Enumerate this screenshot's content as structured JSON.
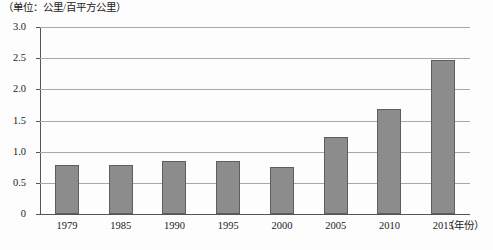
{
  "caption": "（单位：公里/百平方公里）",
  "x_axis_title": "（年份）",
  "chart_data": {
    "type": "bar",
    "title": "",
    "subtitle": "",
    "xlabel": "（年份）",
    "ylabel": "（单位：公里/百平方公里）",
    "categories": [
      "1979",
      "1985",
      "1990",
      "1995",
      "2000",
      "2005",
      "2010",
      "2015"
    ],
    "values": [
      0.78,
      0.78,
      0.85,
      0.85,
      0.76,
      1.23,
      1.68,
      2.47
    ],
    "ylim": [
      0,
      3.0
    ],
    "yticks": [
      "0",
      "0.5",
      "1.0",
      "1.5",
      "2.0",
      "2.5",
      "3.0"
    ],
    "ytick_values": [
      0,
      0.5,
      1.0,
      1.5,
      2.0,
      2.5,
      3.0
    ],
    "grid": true,
    "legend": false,
    "legend_position": "none",
    "bar_color": "#8c8c8c",
    "bar_border_color": "#5e5e5e",
    "gridline_color": "#a8a8a8",
    "axis_color": "#555555",
    "background_color": "#fdfdfd"
  }
}
